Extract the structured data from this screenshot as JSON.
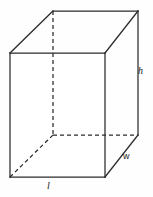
{
  "figure": {
    "name": "rectangular-prism",
    "width_px": 153,
    "height_px": 197,
    "background_color": "#fefefe",
    "stroke_color": "#2b2b2b",
    "stroke_width": 1.25,
    "hidden_edge_dash": "4 3"
  },
  "vertices": {
    "front_top_left": [
      10,
      53
    ],
    "front_top_right": [
      105,
      53
    ],
    "front_bottom_right": [
      105,
      177
    ],
    "front_bottom_left": [
      10,
      177
    ],
    "back_top_left": [
      53,
      11
    ],
    "back_top_right": [
      138,
      11
    ],
    "back_bottom_right": [
      138,
      135
    ],
    "back_bottom_left": [
      53,
      135
    ]
  },
  "edges": {
    "front_face": "M10,53 L105,53 L105,177 L10,177 Z",
    "top_back_left": "M10,53 L53,11",
    "top_back_edge": "M53,11 L138,11",
    "top_right_diagonal": "M105,53 L138,11",
    "right_vertical_back": "M138,11 L138,135",
    "bottom_right_diagonal": "M105,177 L138,135",
    "hidden_vertical": "M53,11 L53,135",
    "hidden_horizontal": "M53,135 L138,135",
    "hidden_diagonal": "M10,177 L53,135"
  },
  "labels": {
    "height": {
      "text": "h",
      "meaning": "height",
      "style": "italic",
      "position": [
        138,
        66
      ]
    },
    "width": {
      "text": "w",
      "meaning": "width",
      "style": "upright",
      "position": [
        123,
        152
      ]
    },
    "length": {
      "text": "l",
      "meaning": "length",
      "style": "italic",
      "position": [
        47,
        181
      ]
    }
  }
}
